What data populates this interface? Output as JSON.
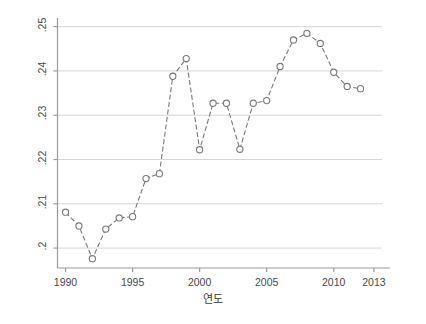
{
  "chart_data": {
    "type": "line",
    "title": "",
    "xlabel": "연도",
    "ylabel": "Wolfson 지수",
    "grid": true,
    "legend": "none",
    "xlim": [
      1989.4,
      2013.6
    ],
    "ylim": [
      0.1955,
      0.2515
    ],
    "xticks": [
      1990,
      1995,
      2000,
      2005,
      2010,
      2013
    ],
    "xtick_labels": [
      "1990",
      "1995",
      "2000",
      "2005",
      "2010",
      "2013"
    ],
    "yticks": [
      0.2,
      0.21,
      0.22,
      0.23,
      0.24,
      0.25
    ],
    "ytick_labels": [
      ".2",
      ".21",
      ".22",
      ".23",
      ".24",
      ".25"
    ],
    "marker": "open-circle",
    "line_style": "dashed",
    "series": [
      {
        "name": "Wolfson 지수",
        "color": "#7a7a7a",
        "x": [
          1990,
          1991,
          1992,
          1993,
          1994,
          1995,
          1996,
          1997,
          1998,
          1999,
          2000,
          2001,
          2002,
          2003,
          2004,
          2005,
          2006,
          2007,
          2008,
          2009,
          2010,
          2011,
          2012
        ],
        "values": [
          0.2081,
          0.205,
          0.1976,
          0.2043,
          0.2068,
          0.2071,
          0.2157,
          0.2168,
          0.2388,
          0.2428,
          0.2222,
          0.2327,
          0.2327,
          0.2223,
          0.2327,
          0.2333,
          0.241,
          0.247,
          0.2485,
          0.2462,
          0.2397,
          0.2365,
          0.236
        ]
      }
    ]
  },
  "axes": {
    "y_title": "Wolfson 지수",
    "x_title": "연도"
  }
}
